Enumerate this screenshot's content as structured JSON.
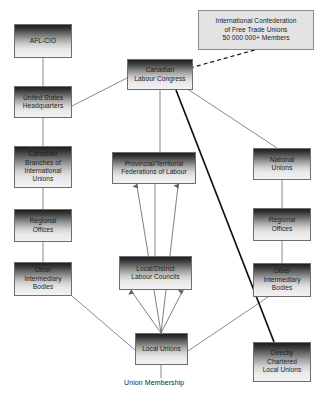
{
  "diagram": {
    "caption": "Union Membership",
    "colors": {
      "box_border": "#6e6e6e",
      "box_top": "#1e1e1e",
      "box_bottom": "#f2f2f2",
      "plain_box_fill": "#e3e3e3",
      "line": "#6b6b6b",
      "thick_line": "#111111",
      "text": "#1b1b1b"
    },
    "nodes": [
      {
        "id": "afl_cio",
        "label": "AFL-CIO",
        "lines": [
          "AFL-CIO"
        ],
        "style": "gradient",
        "x": 14,
        "y": 24,
        "w": 58,
        "h": 34
      },
      {
        "id": "icftu",
        "label": "International Confederation of Free Trade Unions 50 000 000+ Members",
        "lines": [
          "International Confederation",
          "of Free Trade Unions",
          "50 000 000+ Members"
        ],
        "style": "plain",
        "x": 198,
        "y": 10,
        "w": 116,
        "h": 40
      },
      {
        "id": "clc",
        "label": "Canadian Labour Congress",
        "lines": [
          "Canadian",
          "Labour Congress"
        ],
        "style": "gradient",
        "x": 127,
        "y": 59,
        "w": 66,
        "h": 31
      },
      {
        "id": "us_hq",
        "label": "United States Headquarters",
        "lines": [
          "United States",
          "Headquarters"
        ],
        "style": "gradient",
        "x": 14,
        "y": 86,
        "w": 58,
        "h": 32
      },
      {
        "id": "cdn_branches",
        "label": "Canadian Branches of International Unions",
        "lines": [
          "Canadian",
          "Branches of",
          "International",
          "Unions"
        ],
        "style": "gradient",
        "x": 14,
        "y": 146,
        "w": 58,
        "h": 42
      },
      {
        "id": "prov_fed",
        "label": "Provincial/Territorial Federations of Labour",
        "lines": [
          "Provincial/Territorial",
          "Federations of Labour"
        ],
        "style": "gradient",
        "x": 112,
        "y": 152,
        "w": 84,
        "h": 32
      },
      {
        "id": "national_unions",
        "label": "National Unions",
        "lines": [
          "National",
          "Unions"
        ],
        "style": "gradient",
        "x": 253,
        "y": 148,
        "w": 58,
        "h": 32
      },
      {
        "id": "regional_offices_left",
        "label": "Regional Offices",
        "lines": [
          "Regional",
          "Offices"
        ],
        "style": "gradient",
        "x": 14,
        "y": 209,
        "w": 58,
        "h": 33
      },
      {
        "id": "regional_offices_right",
        "label": "Regional Offices",
        "lines": [
          "Regional",
          "Offices"
        ],
        "style": "gradient",
        "x": 253,
        "y": 208,
        "w": 58,
        "h": 33
      },
      {
        "id": "other_bodies_left",
        "label": "Other Intermediary Bodies",
        "lines": [
          "Other",
          "Intermediary",
          "Bodies"
        ],
        "style": "gradient",
        "x": 14,
        "y": 262,
        "w": 58,
        "h": 34
      },
      {
        "id": "other_bodies_right",
        "label": "Other Intermediary Bodies",
        "lines": [
          "Other",
          "Intermediary",
          "Bodies"
        ],
        "style": "gradient",
        "x": 253,
        "y": 263,
        "w": 58,
        "h": 34
      },
      {
        "id": "labour_councils",
        "label": "Local/District Labour Councils",
        "lines": [
          "Local/District",
          "Labour Councils"
        ],
        "style": "gradient",
        "x": 119,
        "y": 256,
        "w": 73,
        "h": 34
      },
      {
        "id": "local_unions",
        "label": "Local Unions",
        "lines": [
          "Local Unions"
        ],
        "style": "gradient",
        "x": 135,
        "y": 333,
        "w": 53,
        "h": 32
      },
      {
        "id": "directly_chartered",
        "label": "Directly Chartered Local Unions",
        "lines": [
          "Directly",
          "Chartered",
          "Local Unions"
        ],
        "style": "gradient",
        "x": 253,
        "y": 342,
        "w": 58,
        "h": 40
      }
    ],
    "edges": [
      {
        "id": "afl-to-ushq",
        "from": "afl_cio",
        "to": "us_hq",
        "kind": "solid",
        "arrow": "none"
      },
      {
        "id": "ushq-to-branches",
        "from": "us_hq",
        "to": "cdn_branches",
        "kind": "solid",
        "arrow": "none"
      },
      {
        "id": "branches-to-regional",
        "from": "cdn_branches",
        "to": "regional_offices_left",
        "kind": "solid",
        "arrow": "none"
      },
      {
        "id": "regional-to-other-left",
        "from": "regional_offices_left",
        "to": "other_bodies_left",
        "kind": "solid",
        "arrow": "none"
      },
      {
        "id": "ushq-to-clc",
        "from": "us_hq",
        "to": "clc",
        "kind": "solid",
        "arrow": "none"
      },
      {
        "id": "clc-to-icftu",
        "from": "clc",
        "to": "icftu",
        "kind": "dashed",
        "arrow": "none"
      },
      {
        "id": "clc-to-prov",
        "from": "clc",
        "to": "prov_fed",
        "kind": "solid",
        "arrow": "none"
      },
      {
        "id": "clc-to-national",
        "from": "clc",
        "to": "national_unions",
        "kind": "solid",
        "arrow": "none"
      },
      {
        "id": "clc-to-directly",
        "from": "clc",
        "to": "directly_chartered",
        "kind": "thick",
        "arrow": "none"
      },
      {
        "id": "national-to-regional",
        "from": "national_unions",
        "to": "regional_offices_right",
        "kind": "solid",
        "arrow": "none"
      },
      {
        "id": "regional-to-other-right",
        "from": "regional_offices_right",
        "to": "other_bodies_right",
        "kind": "solid",
        "arrow": "none"
      },
      {
        "id": "prov-to-councils",
        "from": "prov_fed",
        "to": "labour_councils",
        "kind": "solid",
        "arrow": "none"
      },
      {
        "id": "councils-up-left",
        "from": "local_unions",
        "to": "prov_fed",
        "kind": "solid",
        "arrow": "up"
      },
      {
        "id": "locals-to-councils",
        "from": "local_unions",
        "to": "labour_councils",
        "kind": "solid",
        "arrow": "up"
      },
      {
        "id": "other-left-to-locals",
        "from": "other_bodies_left",
        "to": "local_unions",
        "kind": "solid",
        "arrow": "none"
      },
      {
        "id": "other-right-to-locals",
        "from": "other_bodies_right",
        "to": "local_unions",
        "kind": "solid",
        "arrow": "none"
      },
      {
        "id": "locals-to-membership",
        "from": "local_unions",
        "to": "caption",
        "kind": "solid",
        "arrow": "none"
      }
    ]
  }
}
